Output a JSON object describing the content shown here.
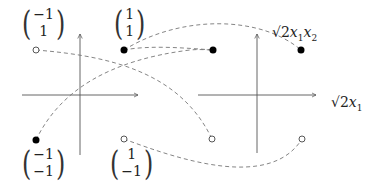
{
  "diagram": {
    "left_plot": {
      "points": [
        {
          "label_top": "-1",
          "label_bottom": "1",
          "x": 36,
          "y": 50,
          "style": "open"
        },
        {
          "label_top": "1",
          "label_bottom": "1",
          "x": 124,
          "y": 50,
          "style": "filled"
        },
        {
          "label_top": "-1",
          "label_bottom": "-1",
          "x": 36,
          "y": 140,
          "style": "filled"
        },
        {
          "label_top": "1",
          "label_bottom": "-1",
          "x": 124,
          "y": 139,
          "style": "open"
        }
      ]
    },
    "right_plot": {
      "x_axis_label": "√2x₁",
      "y_axis_label": "√2x₁x₂",
      "points": [
        {
          "x": 213,
          "y": 50,
          "style": "filled"
        },
        {
          "x": 301,
          "y": 50,
          "style": "filled"
        },
        {
          "x": 212,
          "y": 139,
          "style": "open"
        },
        {
          "x": 302,
          "y": 139,
          "style": "open"
        }
      ]
    },
    "labels": {
      "m1_top": "−1",
      "m1_bot": "1",
      "m2_top": "1",
      "m2_bot": "1",
      "m3_top": "−1",
      "m3_bot": "−1",
      "m4_top": "1",
      "m4_bot": "−1",
      "xlab_sqrt": "√2",
      "xlab_x": "x",
      "xlab_sub": "1",
      "ylab_sqrt": "√2",
      "ylab_x1": "x",
      "ylab_sub1": "1",
      "ylab_x2": "x",
      "ylab_sub2": "2"
    },
    "colors": {
      "axis": "#555555",
      "dash": "#777777",
      "point": "#000000"
    }
  }
}
